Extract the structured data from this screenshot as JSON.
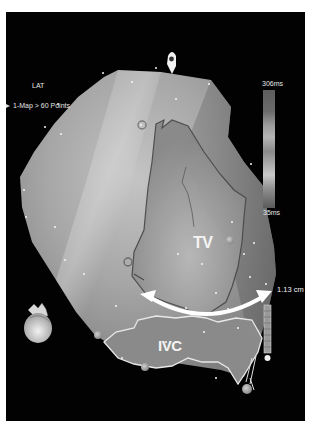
{
  "overlay": {
    "map_type": "LAT",
    "map_info": "1-Map > 60 Points",
    "colorbar": {
      "max_label": "306ms",
      "min_label": "35ms"
    },
    "distance_label": "1.13 cm"
  },
  "anatomy_labels": {
    "tv": "TV",
    "ivc": "IVC"
  },
  "colors": {
    "background": "#020202",
    "border": "#ffffff",
    "outline": "#e8e8e8",
    "annotation_text": "#f4f4f4"
  }
}
